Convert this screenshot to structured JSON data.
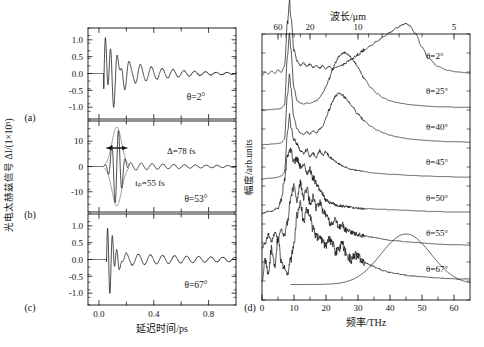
{
  "figure": {
    "left_panel": {
      "tag_a": "(a)",
      "tag_b": "(b)",
      "tag_c": "(c)",
      "y_axis_title": "光电太赫兹信号 ΔI/(1×10⁵)",
      "x_axis_title": "延迟时间/ps",
      "x_ticks": [
        "0.0",
        "0.4",
        "0.8"
      ],
      "x_tick_values": [
        0.0,
        0.4,
        0.8
      ],
      "x_minor_values": [
        0.2,
        0.6
      ],
      "xlim": [
        -0.08,
        1.0
      ],
      "panels": [
        {
          "id": "a",
          "angle_label": "θ=2°",
          "y_ticks": [
            "1.0",
            "0.5",
            "0.0",
            "-0.5",
            "-1.0"
          ],
          "y_tick_values": [
            1.0,
            0.5,
            0.0,
            -0.5,
            -1.0
          ],
          "ylim": [
            -1.35,
            1.35
          ]
        },
        {
          "id": "b",
          "angle_label": "θ=53°",
          "width_label": "Δ=78 fs",
          "pulse_label": "tₚ=55 fs",
          "y_ticks": [
            "10",
            "0",
            "-10"
          ],
          "y_tick_values": [
            10,
            0,
            -10
          ],
          "ylim": [
            -18,
            18
          ]
        },
        {
          "id": "c",
          "angle_label": "θ=67°",
          "y_ticks": [
            "1.0",
            "0.5",
            "0.0",
            "-0.5",
            "-1.0"
          ],
          "y_tick_values": [
            1.0,
            0.5,
            0.0,
            -0.5,
            -1.0
          ],
          "ylim": [
            -1.35,
            1.35
          ]
        }
      ]
    },
    "right_panel": {
      "tag_d": "(d)",
      "y_axis_title": "幅度/arb.units",
      "x_axis_title": "频率/THz",
      "top_axis_title": "波长/μm",
      "x_ticks": [
        "0",
        "10",
        "20",
        "30",
        "40",
        "50",
        "60"
      ],
      "x_tick_values": [
        0,
        10,
        20,
        30,
        40,
        50,
        60
      ],
      "xlim": [
        0,
        65
      ],
      "top_ticks": [
        "60",
        "20",
        "10",
        "5"
      ],
      "top_tick_wavelengths": [
        60,
        20,
        10,
        5
      ],
      "top_minor_wavelengths": [
        50,
        40,
        30,
        25,
        15,
        9,
        8,
        7,
        6
      ],
      "traces": [
        {
          "angle_label": "θ=2°"
        },
        {
          "angle_label": "θ=25°"
        },
        {
          "angle_label": "θ=40°"
        },
        {
          "angle_label": "θ=45°"
        },
        {
          "angle_label": "θ=50°"
        },
        {
          "angle_label": "θ=55°"
        },
        {
          "angle_label": "θ=67°"
        }
      ]
    }
  },
  "chart_data": {
    "type": "line",
    "title": "",
    "panels": [
      {
        "id": "a",
        "type": "line",
        "xlabel": "延迟时间/ps",
        "ylabel": "光电太赫兹信号 ΔI/(1×10⁵)",
        "xlim": [
          -0.08,
          1.0
        ],
        "ylim": [
          -1.35,
          1.35
        ],
        "annotation": "θ=2°",
        "description": "damped terahertz oscillation, onset ~0.05 ps, peak amplitude ~1.2, ringing decays to ~0.1 by 1.0 ps",
        "onset_ps": 0.05,
        "peak_amplitude": 1.2,
        "ring_period_ps": 0.075,
        "decay_ps": 0.3
      },
      {
        "id": "b",
        "type": "line",
        "xlabel": "延迟时间/ps",
        "ylabel": "光电太赫兹信号 ΔI/(1×10⁵)",
        "xlim": [
          -0.08,
          1.0
        ],
        "ylim": [
          -18,
          18
        ],
        "annotations": [
          "Δ=78 fs",
          "tₚ=55 fs",
          "θ=53°"
        ],
        "description": "large single carrier-envelope burst centred at 0.13 ps, peak ~15, envelope FWHM 78 fs, weak ringing tail amplitude ~1.5",
        "center_ps": 0.13,
        "peak_amplitude": 15,
        "envelope_fwhm_fs": 78,
        "pulse_width_fs": 55,
        "ring_period_ps": 0.075
      },
      {
        "id": "c",
        "type": "line",
        "xlabel": "延迟时间/ps",
        "ylabel": "光电太赫兹信号 ΔI/(1×10⁵)",
        "xlim": [
          -0.08,
          1.0
        ],
        "ylim": [
          -1.35,
          1.35
        ],
        "annotation": "θ=67°",
        "description": "fast high-frequency burst near 0.1 ps reaching ~1.2, followed by low-amplitude ~0.2 slow ringing out to 1.0 ps",
        "onset_ps": 0.07,
        "peak_amplitude": 1.2,
        "ring_period_ps": 0.09,
        "decay_ps": 0.12
      },
      {
        "id": "d",
        "type": "line",
        "xlabel": "频率/THz",
        "ylabel": "幅度/arb.units",
        "top_xlabel": "波长/μm",
        "xlim": [
          0,
          65
        ],
        "grid": false,
        "legend": "inline-right",
        "series": [
          {
            "name": "θ=2°",
            "offset": 6,
            "x": [
              0,
              1,
              2,
              3,
              4,
              5,
              6,
              7,
              8,
              9,
              10,
              11,
              12,
              13,
              14,
              15,
              16,
              17,
              18,
              19,
              20,
              21,
              22,
              23,
              24,
              25,
              26,
              27,
              28,
              29,
              30,
              32,
              34,
              36,
              38,
              40,
              42,
              44,
              46,
              48,
              50,
              52,
              55,
              58,
              61,
              65
            ],
            "values": [
              0.15,
              0.55,
              0.3,
              0.75,
              0.45,
              0.95,
              0.5,
              0.4,
              0.3,
              0.55,
              0.85,
              1.35,
              1.6,
              1.25,
              1.45,
              1.3,
              1.1,
              0.95,
              1.0,
              0.85,
              0.8,
              0.95,
              0.85,
              0.7,
              0.75,
              0.85,
              0.7,
              0.6,
              0.55,
              0.65,
              0.6,
              0.5,
              0.45,
              0.4,
              0.35,
              0.32,
              0.3,
              0.28,
              0.26,
              0.25,
              0.24,
              0.23,
              0.22,
              0.21,
              0.2,
              0.2
            ]
          },
          {
            "name": "θ=25°",
            "offset": 5,
            "x": [
              0,
              1,
              2,
              3,
              4,
              5,
              6,
              7,
              8,
              9,
              10,
              11,
              12,
              13,
              14,
              15,
              16,
              17,
              18,
              19,
              20,
              21,
              22,
              23,
              24,
              25,
              26,
              27,
              28,
              29,
              30,
              32,
              34,
              36,
              38,
              40,
              42,
              44,
              46,
              48,
              50,
              52,
              55,
              58,
              61,
              65
            ],
            "values": [
              0.12,
              0.2,
              0.35,
              0.25,
              0.4,
              0.3,
              0.45,
              0.35,
              0.6,
              1.05,
              1.25,
              1.0,
              1.3,
              1.05,
              1.2,
              0.95,
              1.05,
              0.85,
              0.95,
              0.8,
              0.7,
              0.6,
              0.55,
              0.62,
              0.5,
              0.55,
              0.45,
              0.42,
              0.4,
              0.38,
              0.36,
              0.34,
              0.32,
              0.3,
              0.28,
              0.26,
              0.25,
              0.24,
              0.23,
              0.22,
              0.21,
              0.2,
              0.19,
              0.18,
              0.18,
              0.17
            ]
          },
          {
            "name": "θ=40°",
            "offset": 4,
            "x": [
              0,
              1,
              2,
              3,
              4,
              5,
              6,
              7,
              8,
              9,
              10,
              11,
              12,
              13,
              14,
              15,
              16,
              17,
              18,
              19,
              20,
              21,
              22,
              23,
              24,
              25,
              26,
              27,
              28,
              30,
              32,
              34,
              36,
              38,
              40,
              42,
              44,
              46,
              48,
              50,
              52,
              55,
              58,
              61,
              65
            ],
            "values": [
              0.1,
              0.12,
              0.15,
              0.14,
              0.18,
              0.2,
              0.35,
              0.7,
              1.15,
              1.25,
              1.05,
              1.1,
              0.95,
              1.0,
              0.85,
              0.9,
              0.75,
              0.65,
              0.55,
              0.45,
              0.35,
              0.3,
              0.28,
              0.26,
              0.25,
              0.24,
              0.23,
              0.22,
              0.21,
              0.2,
              0.19,
              0.19,
              0.18,
              0.18,
              0.17,
              0.17,
              0.16,
              0.16,
              0.15,
              0.15,
              0.14,
              0.14,
              0.13,
              0.13,
              0.13
            ]
          },
          {
            "name": "θ=45°",
            "offset": 3,
            "x": [
              0,
              1,
              2,
              3,
              4,
              5,
              6,
              7,
              8,
              8.6,
              9,
              10,
              11,
              12,
              13,
              14,
              15,
              16,
              17,
              18,
              19,
              20,
              21,
              22,
              23,
              24,
              25,
              26,
              28,
              30,
              32,
              34,
              36,
              38,
              40,
              42,
              44,
              46,
              48,
              50,
              52,
              55,
              58,
              61,
              65
            ],
            "values": [
              0.08,
              0.09,
              0.1,
              0.1,
              0.11,
              0.12,
              0.14,
              0.2,
              0.95,
              1.25,
              1.05,
              0.8,
              0.72,
              0.6,
              0.55,
              0.62,
              0.5,
              0.55,
              0.48,
              0.6,
              0.52,
              0.58,
              0.5,
              0.45,
              0.4,
              0.36,
              0.33,
              0.3,
              0.26,
              0.24,
              0.22,
              0.2,
              0.19,
              0.18,
              0.17,
              0.17,
              0.16,
              0.15,
              0.15,
              0.14,
              0.14,
              0.13,
              0.13,
              0.12,
              0.12
            ]
          },
          {
            "name": "θ=50°",
            "offset": 2,
            "x": [
              0,
              1,
              2,
              3,
              4,
              5,
              6,
              7,
              8,
              8.6,
              9,
              10,
              11,
              12,
              13,
              14,
              15,
              16,
              17,
              18,
              19,
              20,
              21,
              22,
              23,
              24,
              25,
              26,
              27,
              28,
              30,
              32,
              34,
              36,
              38,
              40,
              42,
              44,
              46,
              48,
              50,
              52,
              55,
              58,
              61,
              65
            ],
            "values": [
              0.06,
              0.07,
              0.07,
              0.08,
              0.08,
              0.09,
              0.1,
              0.16,
              1.0,
              1.35,
              1.1,
              0.55,
              0.35,
              0.28,
              0.25,
              0.3,
              0.26,
              0.32,
              0.28,
              0.35,
              0.4,
              0.55,
              0.7,
              0.85,
              0.95,
              1.0,
              0.98,
              0.92,
              0.85,
              0.78,
              0.62,
              0.5,
              0.4,
              0.33,
              0.28,
              0.24,
              0.21,
              0.19,
              0.17,
              0.16,
              0.15,
              0.14,
              0.13,
              0.12,
              0.12,
              0.11
            ]
          },
          {
            "name": "θ=55°",
            "offset": 1,
            "x": [
              0,
              1,
              2,
              3,
              4,
              5,
              6,
              7,
              8,
              8.6,
              9,
              10,
              11,
              12,
              13,
              14,
              15,
              16,
              17,
              18,
              19,
              20,
              21,
              22,
              23,
              24,
              25,
              26,
              27,
              28,
              29,
              30,
              32,
              34,
              36,
              38,
              40,
              42,
              44,
              46,
              48,
              50,
              52,
              55,
              58,
              61,
              65
            ],
            "values": [
              0.05,
              0.05,
              0.06,
              0.06,
              0.07,
              0.07,
              0.08,
              0.14,
              1.05,
              1.45,
              1.15,
              0.45,
              0.22,
              0.18,
              0.16,
              0.18,
              0.17,
              0.2,
              0.22,
              0.28,
              0.36,
              0.48,
              0.62,
              0.78,
              0.92,
              1.02,
              1.08,
              1.1,
              1.06,
              1.0,
              0.92,
              0.82,
              0.62,
              0.46,
              0.35,
              0.27,
              0.22,
              0.19,
              0.17,
              0.15,
              0.14,
              0.13,
              0.12,
              0.11,
              0.11,
              0.1,
              0.1
            ]
          },
          {
            "name": "θ=67°",
            "offset": 0,
            "x": [
              0,
              1,
              2,
              3,
              4,
              5,
              6,
              7,
              8,
              8.6,
              9,
              10,
              11,
              12,
              13,
              14,
              15,
              16,
              17,
              18,
              19,
              20,
              21,
              22,
              23,
              24,
              25,
              26,
              27,
              28,
              29,
              30,
              32,
              34,
              36,
              38,
              40,
              42,
              44,
              45,
              46,
              48,
              50,
              52,
              55,
              58,
              61,
              65
            ],
            "values": [
              0.04,
              0.1,
              0.06,
              0.12,
              0.07,
              0.14,
              0.09,
              0.2,
              1.0,
              1.4,
              1.1,
              0.5,
              0.3,
              0.22,
              0.26,
              0.2,
              0.24,
              0.18,
              0.22,
              0.17,
              0.21,
              0.16,
              0.2,
              0.16,
              0.18,
              0.2,
              0.22,
              0.26,
              0.3,
              0.34,
              0.38,
              0.42,
              0.5,
              0.58,
              0.66,
              0.74,
              0.82,
              0.9,
              0.96,
              0.98,
              0.95,
              0.8,
              0.55,
              0.35,
              0.2,
              0.13,
              0.1,
              0.08
            ]
          }
        ]
      }
    ]
  }
}
